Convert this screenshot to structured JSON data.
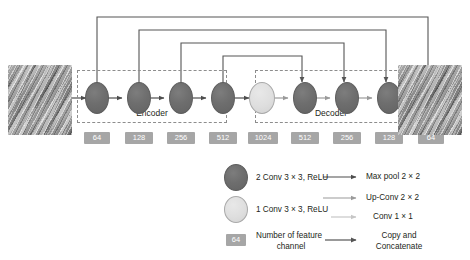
{
  "figure": {
    "type": "diagram",
    "input_image_label": "input texture image",
    "output_image_label": "output texture image"
  },
  "groups": {
    "encoder_label": "Encoder",
    "decoder_label": "Decoder"
  },
  "nodes": [
    {
      "id": "enc1",
      "kind": "dark",
      "channels": "64"
    },
    {
      "id": "enc2",
      "kind": "dark",
      "channels": "128"
    },
    {
      "id": "enc3",
      "kind": "dark",
      "channels": "256"
    },
    {
      "id": "enc4",
      "kind": "dark",
      "channels": "512"
    },
    {
      "id": "bottleneck",
      "kind": "light",
      "channels": "1024"
    },
    {
      "id": "dec1",
      "kind": "dark",
      "channels": "512"
    },
    {
      "id": "dec2",
      "kind": "dark",
      "channels": "256"
    },
    {
      "id": "dec3",
      "kind": "dark",
      "channels": "128"
    },
    {
      "id": "dec4",
      "kind": "dark",
      "channels": "64"
    }
  ],
  "channel_labels": [
    "64",
    "128",
    "256",
    "512",
    "1024",
    "512",
    "256",
    "128",
    "64"
  ],
  "skip_connections": [
    {
      "from": "enc1",
      "to": "dec4"
    },
    {
      "from": "enc2",
      "to": "dec3"
    },
    {
      "from": "enc3",
      "to": "dec2"
    },
    {
      "from": "enc4",
      "to": "dec1"
    }
  ],
  "legend": {
    "shapes": [
      {
        "icon": "dark-circle",
        "label": "2 Conv 3 × 3, ReLU"
      },
      {
        "icon": "light-circle",
        "label": "1 Conv 3 × 3, ReLU"
      },
      {
        "icon": "gray-chip",
        "chip_value": "64",
        "label_line1": "Number of feature",
        "label_line2": "channel"
      }
    ],
    "arrows": [
      {
        "icon": "arrow-dark",
        "label": "Max pool 2 × 2"
      },
      {
        "icon": "arrow-medium",
        "label": "Up-Conv 2 × 2"
      },
      {
        "icon": "arrow-light",
        "label": "Conv 1 × 1"
      },
      {
        "icon": "arrow-skip",
        "label_line1": "Copy and",
        "label_line2": "Concatenate"
      }
    ]
  },
  "colors": {
    "node_dark": "#6e6e6e",
    "node_light": "#dedede",
    "chip": "#a6a6a6",
    "arrow_dark": "#4d4d4d",
    "arrow_medium": "#9a9a9a",
    "arrow_light": "#c6c6c6",
    "dashed_box": "#8d8d8d",
    "text": "#231f20",
    "background": "#ffffff"
  }
}
